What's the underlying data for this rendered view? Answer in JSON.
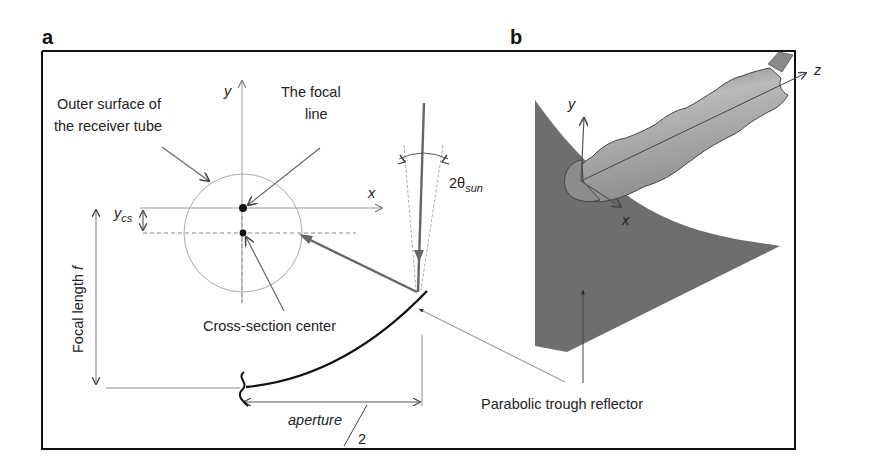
{
  "figure": {
    "panel_a": {
      "letter": "a",
      "labels": {
        "outer_surface_line1": "Outer surface of",
        "outer_surface_line2": "the receiver tube",
        "focal_line_line1": "The focal",
        "focal_line_line2": "line",
        "axis_y": "y",
        "axis_x": "x",
        "y_cs_main": "y",
        "y_cs_sub": "cs",
        "two_theta": "2θ",
        "theta_sub": "sun",
        "focal_length": "Focal length ",
        "focal_length_var": "f",
        "cross_section_center": "Cross-section center",
        "aperture": "aperture",
        "aperture_divisor": "2"
      }
    },
    "panel_b": {
      "letter": "b",
      "labels": {
        "axis_y": "y",
        "axis_x": "x",
        "axis_z": "z",
        "reflector": "Parabolic trough reflector"
      }
    },
    "colors": {
      "frame": "#111111",
      "reflector_fill": "#6e6e6e",
      "tube_fill": "#9a9a9a",
      "thin_line": "#8a8a8a",
      "ray_line": "#666666",
      "curve": "#111111"
    }
  }
}
